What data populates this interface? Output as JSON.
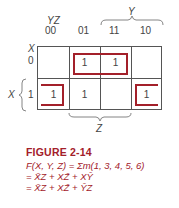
{
  "kmap": {
    "corner_label_cols": "YZ",
    "corner_label_rows": "X",
    "col_headers": [
      "00",
      "01",
      "11",
      "10"
    ],
    "row_headers": [
      "0",
      "1"
    ],
    "cells": [
      [
        "",
        "1",
        "1",
        ""
      ],
      [
        "1",
        "1",
        "",
        "1"
      ]
    ],
    "brace_top_label": "Y",
    "brace_left_label": "X",
    "brace_bottom_label": "Z",
    "loop_color": "#a3202a"
  },
  "caption": {
    "title": "FIGURE 2-14",
    "line1": "F(X, Y, Z) = Σm(1, 3, 4, 5, 6)",
    "line2": {
      "prefix": "= ",
      "terms": [
        "X̄Z",
        "XZ̄",
        "XȲ"
      ]
    },
    "line3": {
      "prefix": "= ",
      "terms": [
        "X̄Z",
        "XZ̄",
        "ȲZ"
      ]
    },
    "color": "#a3202a"
  }
}
